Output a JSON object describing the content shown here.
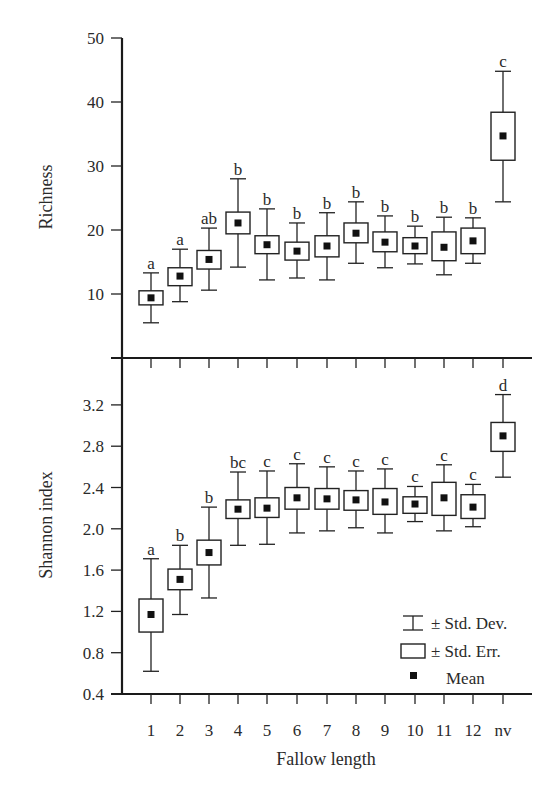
{
  "chart_data": [
    {
      "type": "box",
      "panel": "top",
      "title": "",
      "xlabel": "",
      "ylabel": "Richness",
      "ylim": [
        0,
        50
      ],
      "yticks": [
        10,
        20,
        30,
        40,
        50
      ],
      "ytick_labels": [
        "10",
        "20",
        "30",
        "40",
        "50"
      ],
      "categories": [
        "1",
        "2",
        "3",
        "4",
        "5",
        "6",
        "7",
        "8",
        "9",
        "10",
        "11",
        "12",
        "nv"
      ],
      "mean": [
        9.4,
        12.8,
        15.4,
        21.1,
        17.7,
        16.7,
        17.5,
        19.5,
        18.1,
        17.5,
        17.3,
        18.3,
        34.7
      ],
      "se_low": [
        8.3,
        11.3,
        13.9,
        19.4,
        16.3,
        15.3,
        15.8,
        18.0,
        16.6,
        16.3,
        15.2,
        16.3,
        30.9
      ],
      "se_high": [
        10.5,
        14.1,
        16.8,
        22.8,
        19.1,
        18.1,
        19.1,
        21.1,
        19.7,
        18.8,
        19.7,
        20.3,
        38.4
      ],
      "sd_low": [
        5.5,
        8.8,
        10.6,
        14.2,
        12.2,
        12.5,
        12.2,
        14.8,
        14.1,
        14.7,
        13.0,
        14.8,
        24.4
      ],
      "sd_high": [
        13.3,
        17.0,
        20.3,
        28.0,
        23.3,
        21.1,
        22.7,
        24.4,
        22.2,
        20.6,
        22.0,
        21.9,
        44.8
      ],
      "letters": [
        "a",
        "a",
        "ab",
        "b",
        "b",
        "b",
        "b",
        "b",
        "b",
        "b",
        "b",
        "b",
        "c"
      ],
      "grid": false
    },
    {
      "type": "box",
      "panel": "bottom",
      "title": "",
      "xlabel": "Fallow length",
      "ylabel": "Shannon index",
      "ylim": [
        0.4,
        3.5
      ],
      "yticks": [
        0.4,
        0.8,
        1.2,
        1.6,
        2.0,
        2.4,
        2.8,
        3.2
      ],
      "ytick_labels": [
        "0.4",
        "0.8",
        "1.2",
        "1.6",
        "2.0",
        "2.4",
        "2.8",
        "3.2"
      ],
      "categories": [
        "1",
        "2",
        "3",
        "4",
        "5",
        "6",
        "7",
        "8",
        "9",
        "10",
        "11",
        "12",
        "nv"
      ],
      "mean": [
        1.17,
        1.51,
        1.77,
        2.19,
        2.2,
        2.3,
        2.29,
        2.28,
        2.26,
        2.24,
        2.3,
        2.21,
        2.9
      ],
      "se_low": [
        1.0,
        1.41,
        1.65,
        2.1,
        2.11,
        2.19,
        2.19,
        2.18,
        2.14,
        2.15,
        2.13,
        2.1,
        2.75
      ],
      "se_high": [
        1.32,
        1.61,
        1.89,
        2.28,
        2.3,
        2.4,
        2.39,
        2.37,
        2.39,
        2.31,
        2.45,
        2.33,
        3.03
      ],
      "sd_low": [
        0.62,
        1.17,
        1.33,
        1.84,
        1.85,
        1.96,
        1.98,
        2.01,
        1.96,
        2.07,
        1.98,
        2.02,
        2.5
      ],
      "sd_high": [
        1.71,
        1.84,
        2.21,
        2.55,
        2.56,
        2.63,
        2.6,
        2.56,
        2.58,
        2.41,
        2.62,
        2.43,
        3.3
      ],
      "letters": [
        "a",
        "b",
        "b",
        "bc",
        "c",
        "c",
        "c",
        "c",
        "c",
        "c",
        "c",
        "c",
        "d"
      ],
      "grid": false,
      "legend": {
        "position": "lower right",
        "entries": [
          {
            "symbol": "whisker",
            "label": "± Std. Dev."
          },
          {
            "symbol": "box",
            "label": "± Std. Err."
          },
          {
            "symbol": "square",
            "label": "Mean"
          }
        ]
      }
    }
  ],
  "labels": {
    "top_ylabel": "Richness",
    "bottom_ylabel": "Shannon index",
    "xlabel": "Fallow length"
  },
  "legend": {
    "sd": "± Std. Dev.",
    "se": "± Std. Err.",
    "mean": "Mean"
  },
  "colors": {
    "ink": "#222222",
    "mean_fill": "#111111",
    "background": "#ffffff"
  }
}
